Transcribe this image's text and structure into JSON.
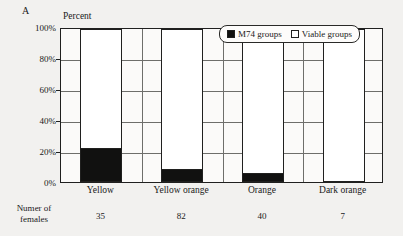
{
  "panel_label": "A",
  "legend": {
    "entries": [
      {
        "label": "M74 groups",
        "swatch": "black-square-icon",
        "color": "#111110"
      },
      {
        "label": "Viable groups",
        "swatch": "white-square-icon",
        "color": "#ffffff"
      }
    ]
  },
  "footer": {
    "row_title_line1": "Numer of",
    "row_title_line2": "females",
    "values": [
      "35",
      "82",
      "40",
      "7"
    ]
  },
  "chart_data": {
    "type": "bar",
    "subtype": "stacked-100-percent",
    "title": "",
    "xlabel": "",
    "ylabel": "Percent",
    "ylim": [
      0,
      100
    ],
    "yticks": [
      0,
      20,
      40,
      60,
      80,
      100
    ],
    "ytick_labels": [
      "0%",
      "20%",
      "40%",
      "60%",
      "80%",
      "100%"
    ],
    "grid": "horizontal",
    "legend_position": "top-right-inside",
    "categories": [
      "Yellow",
      "Yellow orange",
      "Orange",
      "Dark orange"
    ],
    "sample_sizes": [
      35,
      82,
      40,
      7
    ],
    "series": [
      {
        "name": "M74 groups",
        "color": "#111110",
        "values": [
          21,
          8,
          5,
          0
        ]
      },
      {
        "name": "Viable groups",
        "color": "#ffffff",
        "values": [
          79,
          92,
          95,
          100
        ]
      }
    ]
  }
}
